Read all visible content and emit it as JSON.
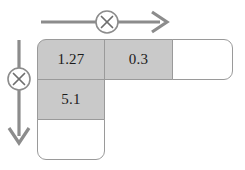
{
  "diagram": {
    "type": "multiplication-grid",
    "colors": {
      "shaded_cell": "#c9c9c9",
      "empty_cell": "#ffffff",
      "grid_line": "#9a9a9a",
      "arrow": "#8c8c8c",
      "text": "#1b1b1b"
    },
    "operators": {
      "horizontal": {
        "symbol": "×",
        "icon": "multiply-circle-icon",
        "direction": "right",
        "label": "column multiply operator"
      },
      "vertical": {
        "symbol": "×",
        "icon": "multiply-circle-icon",
        "direction": "down",
        "label": "row multiply operator"
      }
    },
    "grid": {
      "columns": 3,
      "rows": 3,
      "cells": [
        [
          {
            "value": "1.27",
            "shaded": true
          },
          {
            "value": "0.3",
            "shaded": true
          },
          {
            "value": "",
            "shaded": false
          }
        ],
        [
          {
            "value": "5.1",
            "shaded": true
          },
          {
            "value": "",
            "shaded": false
          },
          {
            "value": "",
            "shaded": false
          }
        ],
        [
          {
            "value": "",
            "shaded": false
          },
          {
            "value": "",
            "shaded": false
          },
          {
            "value": "",
            "shaded": false
          }
        ]
      ]
    }
  }
}
